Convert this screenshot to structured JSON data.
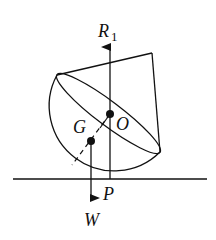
{
  "diagram": {
    "labels": {
      "reaction": "R",
      "reaction_sub": "1",
      "center": "O",
      "centroid": "G",
      "contact": "P",
      "weight": "W"
    },
    "colors": {
      "stroke": "#111111",
      "background": "#ffffff"
    }
  }
}
